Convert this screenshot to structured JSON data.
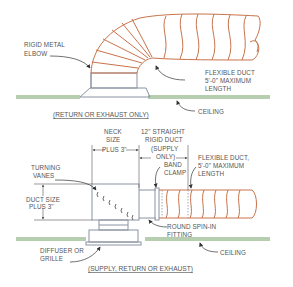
{
  "colors": {
    "flex_duct": "#c8734a",
    "metal": "#8a93a3",
    "ceiling": "#6f9d62",
    "text": "#555555",
    "leader": "#333333"
  },
  "top_detail": {
    "caption": "(RETURN OR EXHAUST ONLY)",
    "labels": {
      "elbow_1": "RIGID METAL",
      "elbow_2": "ELBOW",
      "flex_1": "FLEXIBLE DUCT",
      "flex_2": "5'-0\" MAXIMUM",
      "flex_3": "LENGTH",
      "ceiling": "CEILING"
    }
  },
  "bottom_detail": {
    "caption": "(SUPPLY, RETURN OR EXHAUST)",
    "labels": {
      "neck_1": "NECK",
      "neck_2": "SIZE",
      "neck_3": "PLUS 3\"",
      "straight_1": "12\" STRAIGHT",
      "straight_2": "RIGID DUCT",
      "straight_3": "(SUPPLY",
      "straight_4": "ONLY)",
      "band_1": "BAND",
      "band_2": "CLAMP",
      "flex_1": "FLEXIBLE DUCT,",
      "flex_2": "5'-0\" MAXIMUM",
      "flex_3": "LENGTH",
      "vanes_1": "TURNING",
      "vanes_2": "VANES",
      "duct_1": "DUCT SIZE",
      "duct_2": "PLUS 3\"",
      "spin_1": "ROUND SPIN-IN",
      "spin_2": "FITTING",
      "diffuser_1": "DIFFUSER OR",
      "diffuser_2": "GRILLE",
      "ceiling": "CEILING"
    }
  }
}
